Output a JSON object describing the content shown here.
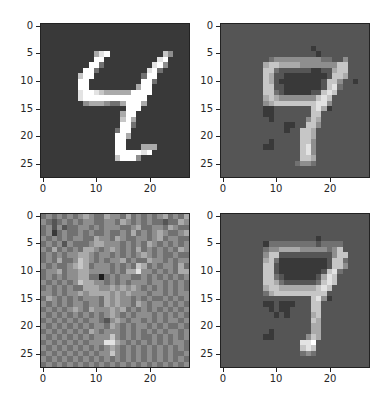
{
  "figure": {
    "layout": "2x2 grid of grayscale images",
    "colormap": "gray",
    "levels_scale": "each character 0-9 maps to intensity 0..255 (digit/9)"
  },
  "chart_data": [
    {
      "type": "heatmap",
      "title": "",
      "description": "Original digit (4)",
      "xlim": [
        0,
        28
      ],
      "ylim": [
        28,
        0
      ],
      "xticks": [
        "0",
        "10",
        "20"
      ],
      "yticks": [
        "0",
        "5",
        "10",
        "15",
        "20",
        "25"
      ],
      "pixels": [
        "2222222222222222222222222222",
        "2222222222222222222222222222",
        "2222222222222222222222222222",
        "2222222222222222222222222222",
        "2222222222222222222222222222",
        "2222222222689222222222275222",
        "2222222222992222222222892222",
        "2222222229942222222228952222",
        "2222222299422222222289422222",
        "2222222799222222222499222222",
        "2222222992222222222994222222",
        "2222222992222222226992222222",
        "2222222899876666699992222222",
        "2222222899999999999922222222",
        "2222222256665446999622222222",
        "2222222222222222999222222222",
        "2222222222222226992222222222",
        "2222222222222227962222222222",
        "2222222222222229942222222222",
        "2222222222222249922222222222",
        "2222222222222299622222222222",
        "2222222222222299222222222222",
        "2222222222222299222666222222",
        "2222222222222299999892222222",
        "2222222222222279995222222222",
        "2222222222222222222222222222",
        "2222222222222222222222222222",
        "2222222222222222222222222222"
      ]
    },
    {
      "type": "heatmap",
      "title": "",
      "description": "Reconstruction of original",
      "xlim": [
        0,
        28
      ],
      "ylim": [
        28,
        0
      ],
      "xticks": [
        "0",
        "10",
        "20"
      ],
      "yticks": [
        "0",
        "5",
        "10",
        "15",
        "20",
        "25"
      ],
      "pixels": [
        "3333333333333333333333333333",
        "3333333333333333333333333333",
        "3333333333333333333333333333",
        "3333333333333333333333333333",
        "3333333333333333323333333333",
        "3333333333333333332333333333",
        "3333333334555555555443353333",
        "3333333367766665555555773333",
        "3333333377433333322336773333",
        "3333333376332222222237763333",
        "3333333376322222222377533233",
        "3333333377332222222378433333",
        "3333333377432222233787333333",
        "3333333367655555557873333333",
        "3333333356777777778853333333",
        "3333333322333333378623333333",
        "3333333322333333377333333333",
        "3333333332333333576333333333",
        "3333333333332233775333333333",
        "3333333333332337763333333333",
        "3333333333333337763333333333",
        "3333333332333337753333333333",
        "3333333322333337853333333333",
        "3333333333333337853333333333",
        "3333333333333337763333333333",
        "3333333333333345543333333333",
        "3333333333333333333333333333",
        "3333333333333333333333333333"
      ]
    },
    {
      "type": "heatmap",
      "title": "",
      "description": "Noisy input",
      "xlim": [
        0,
        28
      ],
      "ylim": [
        28,
        0
      ],
      "xticks": [
        "0",
        "10",
        "20"
      ],
      "yticks": [
        "0",
        "5",
        "10",
        "15",
        "20",
        "25"
      ],
      "pixels": [
        "4545454565446554645454564546",
        "5434545455445546545454434465",
        "4535344554545554456445546544",
        "4524544545445445464545654456",
        "5454545544655465445545645544",
        "4545354445665554545465454545",
        "5464545466545654546454545465",
        "4545455665455454545654544544",
        "4546445765454556454465545455",
        "5454456764555454547645455464",
        "4556455665555454668554545466",
        "4545455664414545544545454545",
        "5454545766554545455545545454",
        "4545454466655656565454545454",
        "5545455656666565655545545455",
        "4654545455546565545454454545",
        "5454545545546565546545545454",
        "4545456546555656454545454545",
        "5454545454545654545554545454",
        "4545454545543565455454545545",
        "5454545454554654545545454454",
        "4545454546545554545454545545",
        "5454545454555754545445454545",
        "4545454545558865454545454554",
        "5454545454545654545454545454",
        "4545454545455754545454545445",
        "5454545454545454545454545454",
        "4545454545454545454545454545"
      ]
    },
    {
      "type": "heatmap",
      "title": "",
      "description": "Reconstruction of noisy input",
      "xlim": [
        0,
        28
      ],
      "ylim": [
        28,
        0
      ],
      "xticks": [
        "0",
        "10",
        "20"
      ],
      "yticks": [
        "0",
        "5",
        "10",
        "15",
        "20",
        "25"
      ],
      "pixels": [
        "3333333333333333333333333333",
        "3333333333333333333333333333",
        "3333333333333333333333333333",
        "3333333333333333333333333333",
        "3333333333333333332333333333",
        "3333333324444444443444433333",
        "3333333345566665555545733333",
        "3333333357733333333335773333",
        "3333333367422222222237743333",
        "3333333377322222222237753333",
        "3333333377322222222378433333",
        "3333333377432222223687333333",
        "3333333377643333334787333333",
        "3333333367766666667873333333",
        "3333333346777777777733333333",
        "3333333333333333378523333333",
        "3333333322322233377333333333",
        "3333333332322333377333333333",
        "3333333333232333367333333333",
        "3333333333333333376333333333",
        "3333333333333333366333333333",
        "3333333332333333366333333333",
        "3333333322333333576333333333",
        "3333333333333338893333333333",
        "3333333333333337873333333333",
        "3333333333333334543333333333",
        "3333333333333333333333333333",
        "3333333333333333333333333333"
      ]
    }
  ]
}
